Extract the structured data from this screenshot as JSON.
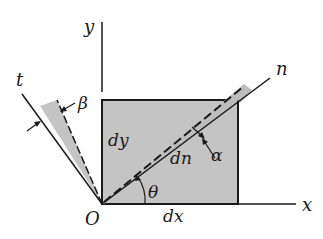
{
  "diagram": {
    "type": "strain-element-rotation",
    "colors": {
      "fill": "#c4c4c4",
      "line": "#1a1a1a",
      "background": "#ffffff"
    },
    "axes": {
      "x_label": "x",
      "y_label": "y",
      "n_label": "n",
      "t_label": "t",
      "origin_label": "O"
    },
    "element": {
      "width_label": "dx",
      "height_label": "dy",
      "diagonal_label": "dn"
    },
    "angles": {
      "theta_label": "θ",
      "alpha_label": "α",
      "beta_label": "β"
    }
  }
}
